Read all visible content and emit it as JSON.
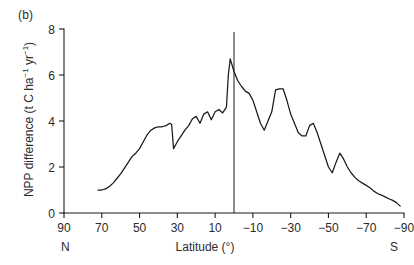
{
  "figure": {
    "panel_label": "(b)",
    "hemisphere_left": "N",
    "hemisphere_right": "S"
  },
  "chart_data": {
    "type": "line",
    "title": "",
    "panel": "(b)",
    "xlabel": "Latitude (°)",
    "ylabel": "NPP difference (t C ha⁻¹ yr⁻¹)",
    "ylabel_parts": {
      "prefix": "NPP difference (t C ha",
      "sup1": "−1",
      "mid": " yr",
      "sup2": "−1",
      "suffix": ")"
    },
    "xlim": [
      90,
      -90
    ],
    "ylim": [
      0,
      8
    ],
    "xticks": [
      90,
      70,
      50,
      30,
      10,
      -10,
      -30,
      -50,
      -70,
      -90
    ],
    "xticklabels": [
      "90",
      "70",
      "50",
      "30",
      "10",
      "−10",
      "−30",
      "−50",
      "−70",
      "−90"
    ],
    "yticks": [
      0,
      2,
      4,
      6,
      8
    ],
    "yticklabels": [
      "0",
      "2",
      "4",
      "6",
      "8"
    ],
    "grid": false,
    "legend": null,
    "annotations": [
      {
        "type": "vline",
        "x": 0,
        "label": "equator-reference-line"
      }
    ],
    "series": [
      {
        "name": "NPP difference",
        "x": [
          72,
          70,
          68,
          66,
          64,
          62,
          60,
          58,
          56,
          54,
          52,
          50,
          48,
          46,
          44,
          42,
          40,
          38,
          36,
          34,
          33,
          32,
          30,
          28,
          26,
          24,
          22,
          20,
          18,
          16,
          14,
          12,
          10,
          8,
          6,
          4,
          3,
          2,
          0,
          -2,
          -4,
          -6,
          -8,
          -10,
          -12,
          -14,
          -16,
          -18,
          -20,
          -22,
          -24,
          -26,
          -28,
          -30,
          -32,
          -34,
          -36,
          -38,
          -40,
          -42,
          -44,
          -46,
          -48,
          -50,
          -52,
          -54,
          -56,
          -58,
          -60,
          -62,
          -64,
          -66,
          -68,
          -70,
          -72,
          -74,
          -76,
          -78,
          -80,
          -82,
          -84,
          -86,
          -88
        ],
        "y": [
          1.0,
          1.0,
          1.05,
          1.15,
          1.3,
          1.5,
          1.7,
          1.95,
          2.2,
          2.45,
          2.6,
          2.8,
          3.1,
          3.4,
          3.6,
          3.7,
          3.75,
          3.75,
          3.8,
          3.9,
          3.85,
          2.8,
          3.1,
          3.35,
          3.6,
          3.8,
          4.1,
          4.2,
          3.9,
          4.3,
          4.4,
          4.05,
          4.4,
          4.5,
          4.35,
          4.6,
          6.0,
          6.7,
          6.15,
          5.75,
          5.5,
          5.3,
          5.2,
          4.9,
          4.4,
          3.9,
          3.6,
          4.0,
          4.4,
          5.35,
          5.4,
          5.4,
          4.9,
          4.3,
          3.9,
          3.5,
          3.35,
          3.35,
          3.8,
          3.9,
          3.5,
          3.0,
          2.5,
          2.0,
          1.75,
          2.2,
          2.6,
          2.35,
          2.0,
          1.75,
          1.55,
          1.4,
          1.3,
          1.2,
          1.1,
          0.95,
          0.85,
          0.78,
          0.7,
          0.62,
          0.55,
          0.45,
          0.3
        ]
      }
    ]
  }
}
